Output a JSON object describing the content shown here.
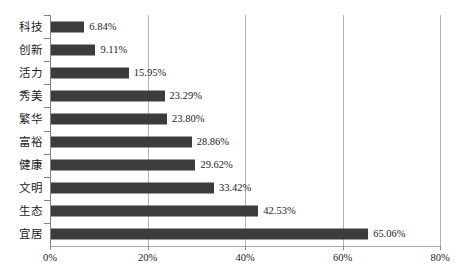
{
  "chart_data": {
    "type": "bar",
    "orientation": "horizontal",
    "title": "",
    "subtitle": "",
    "xlabel": "",
    "ylabel": "",
    "xlim": [
      0,
      80
    ],
    "grid": true,
    "legend": false,
    "legend_position": "none",
    "bar_color": "#3c3c3c",
    "gridline_color": "#b4b4b4",
    "axis_color": "#808080",
    "value_suffix": "%",
    "categories": [
      "科技",
      "创新",
      "活力",
      "秀美",
      "繁华",
      "富裕",
      "健康",
      "文明",
      "生态",
      "宜居"
    ],
    "values": [
      6.84,
      9.11,
      15.95,
      23.29,
      23.8,
      28.86,
      29.62,
      33.42,
      42.53,
      65.06
    ],
    "value_labels": [
      "6.84%",
      "9.11%",
      "15.95%",
      "23.29%",
      "23.80%",
      "28.86%",
      "29.62%",
      "33.42%",
      "42.53%",
      "65.06%"
    ],
    "xticks": [
      0,
      20,
      40,
      60,
      80
    ],
    "xtick_labels": [
      "0%",
      "20%",
      "40%",
      "60%",
      "80%"
    ]
  }
}
